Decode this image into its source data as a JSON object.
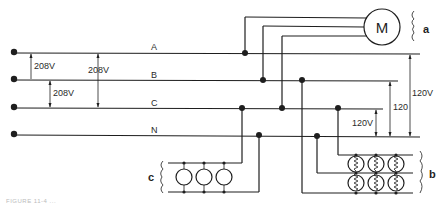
{
  "diagram": {
    "lines": [
      {
        "id": "A",
        "label": "A"
      },
      {
        "id": "B",
        "label": "B"
      },
      {
        "id": "C",
        "label": "C"
      },
      {
        "id": "N",
        "label": "N"
      }
    ],
    "voltages": {
      "ab": "208V",
      "ac": "208V",
      "bc": "208V",
      "an": "120V",
      "bn": "120",
      "cn": "120V"
    },
    "motor_label": "M",
    "group_labels": {
      "motor": "a",
      "single_phase_loads": "b",
      "three_phase_loads": "c"
    },
    "caption": "FIGURE 11-4 ..."
  }
}
